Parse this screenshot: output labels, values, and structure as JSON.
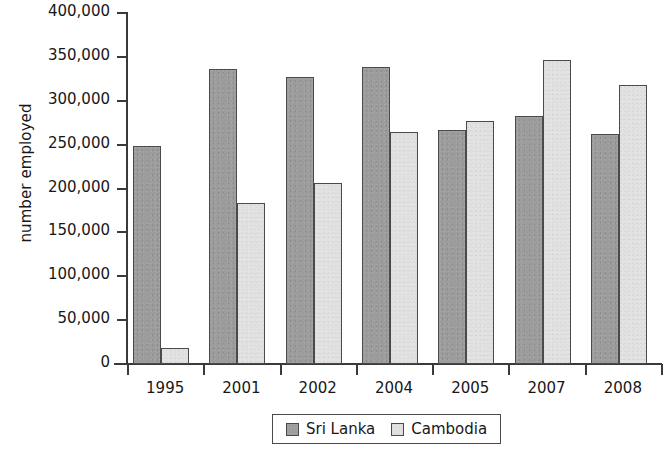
{
  "chart_data": {
    "type": "bar",
    "title": "",
    "xlabel": "",
    "ylabel": "number employed",
    "categories": [
      "1995",
      "2001",
      "2002",
      "2004",
      "2005",
      "2007",
      "2008"
    ],
    "series": [
      {
        "name": "Sri Lanka",
        "color": "#9c9c9c",
        "values": [
          249000,
          336000,
          327000,
          338000,
          267000,
          283000,
          262000
        ]
      },
      {
        "name": "Cambodia",
        "color": "#e2e2e2",
        "values": [
          18000,
          183000,
          206000,
          264000,
          277000,
          347000,
          318000
        ]
      }
    ],
    "ylim": [
      0,
      400000
    ],
    "ytick_values": [
      0,
      50000,
      100000,
      150000,
      200000,
      250000,
      300000,
      350000,
      400000
    ],
    "ytick_labels": [
      "0",
      "50,000",
      "100,000",
      "150,000",
      "200,000",
      "250,000",
      "300,000",
      "350,000",
      "400,000"
    ],
    "grid": false,
    "legend_position": "bottom-center"
  },
  "legend": {
    "entries": [
      {
        "label": "Sri Lanka",
        "swatch": "dark-gray-swatch"
      },
      {
        "label": "Cambodia",
        "swatch": "light-gray-swatch"
      }
    ]
  }
}
